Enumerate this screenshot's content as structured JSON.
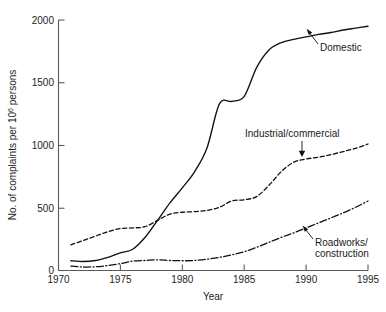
{
  "chart_data": {
    "type": "line",
    "title": "",
    "subtitle": "",
    "xlabel": "Year",
    "ylabel": "No. of complaints per 10⁶ persons",
    "ylabel_prefix": "No. of complaints per 10",
    "ylabel_exponent": "6",
    "ylabel_suffix": " persons",
    "xlim": [
      1970,
      1995
    ],
    "ylim": [
      0,
      2000
    ],
    "xticks": [
      1970,
      1975,
      1980,
      1985,
      1990,
      1995
    ],
    "yticks": [
      0,
      500,
      1000,
      1500,
      2000
    ],
    "xtick_labels": [
      "1970",
      "1975",
      "1980",
      "1985",
      "1990",
      "1995"
    ],
    "ytick_labels": [
      "0",
      "500",
      "1000",
      "1500",
      "2000"
    ],
    "grid": false,
    "legend_position": "inline-annotations",
    "x": [
      1971,
      1972,
      1973,
      1974,
      1975,
      1976,
      1977,
      1978,
      1979,
      1980,
      1981,
      1982,
      1983,
      1984,
      1985,
      1986,
      1987,
      1988,
      1989,
      1990,
      1991,
      1992,
      1993,
      1994,
      1995
    ],
    "series": [
      {
        "name": "Domestic",
        "style": "solid",
        "values": [
          78,
          72,
          80,
          105,
          140,
          170,
          265,
          400,
          540,
          660,
          790,
          980,
          1330,
          1350,
          1390,
          1620,
          1760,
          1820,
          1845,
          1865,
          1885,
          1900,
          1920,
          1935,
          1950
        ]
      },
      {
        "name": "Industrial/commercial",
        "style": "dashed",
        "values": [
          205,
          240,
          275,
          310,
          335,
          340,
          350,
          400,
          450,
          465,
          470,
          480,
          505,
          555,
          565,
          590,
          680,
          790,
          865,
          890,
          905,
          925,
          950,
          975,
          1010
        ]
      },
      {
        "name": "Roadworks/construction",
        "style": "dash-dot",
        "values": [
          35,
          28,
          30,
          40,
          55,
          75,
          80,
          85,
          80,
          78,
          80,
          90,
          105,
          125,
          150,
          185,
          225,
          265,
          300,
          340,
          380,
          420,
          460,
          505,
          555
        ]
      }
    ],
    "annotations": [
      {
        "label": "Domestic",
        "lines": [
          "Domestic"
        ],
        "target_x": 1990,
        "target_y": 1865
      },
      {
        "label": "Industrial/commercial",
        "lines": [
          "Industrial/commercial"
        ],
        "target_x": 1989.5,
        "target_y": 875
      },
      {
        "label": "Roadworks/construction",
        "lines": [
          "Roadworks/",
          "construction"
        ],
        "target_x": 1990,
        "target_y": 340
      }
    ]
  }
}
